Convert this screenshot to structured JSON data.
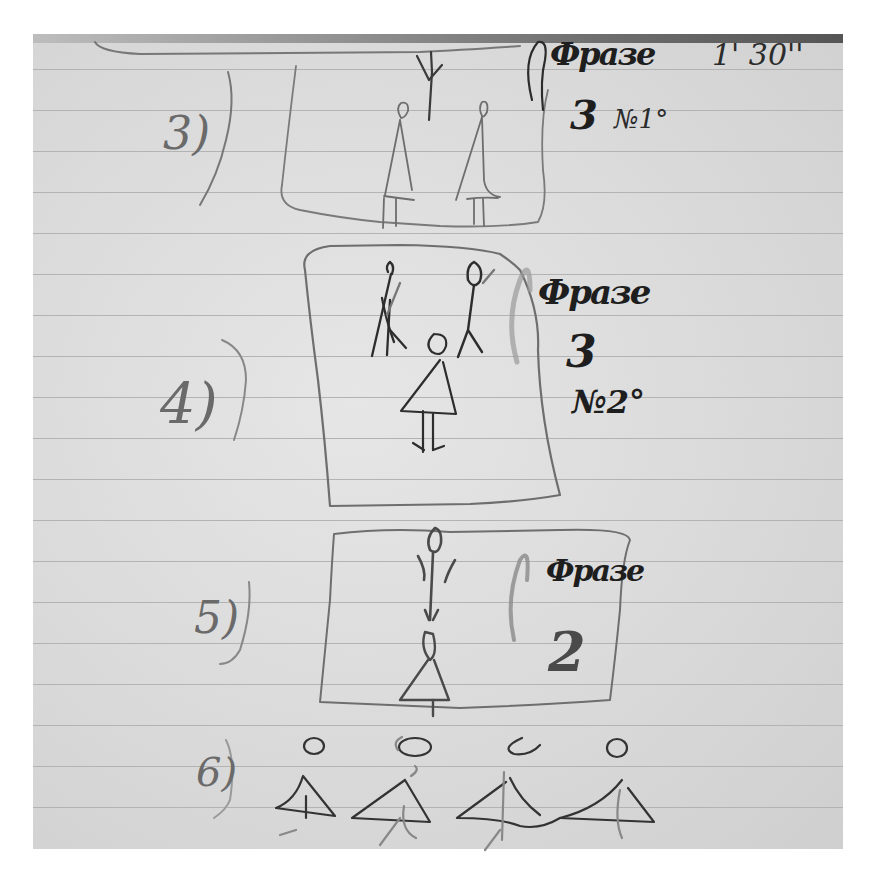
{
  "document": {
    "type": "handwritten notebook sketch",
    "paper": {
      "style": "lined notebook page",
      "color": "#dcdcdc",
      "rule_color": "#b3b3b3",
      "ink_color": "#2b2b2b",
      "pencil_color": "#6a6a6a"
    },
    "timing": "1' 30''",
    "frames": [
      {
        "number": "3)",
        "label": "Фразе",
        "count": "3",
        "note": "№1°",
        "figures": [
          "arms-raised figure",
          "figure in dress",
          "figure in dress"
        ]
      },
      {
        "number": "4)",
        "label": "Фразе",
        "count": "3",
        "note": "№2°",
        "figures": [
          "figure with arm raised",
          "figure",
          "figure in dress"
        ]
      },
      {
        "number": "5)",
        "label": "Фразе",
        "count": "2",
        "note": "",
        "figures": [
          "standing figure",
          "figure in dress"
        ]
      },
      {
        "number": "6)",
        "label": "",
        "count": "",
        "note": "",
        "figures": [
          "figure in dress",
          "figure in dress",
          "figure in dress",
          "figure in dress"
        ]
      }
    ]
  }
}
